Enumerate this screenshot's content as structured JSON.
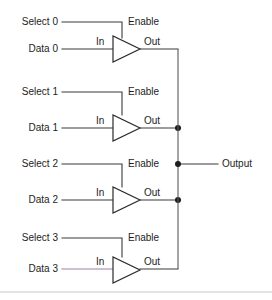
{
  "diagram": {
    "background_color": "#ffffff",
    "wire_color": "#3a3a3a",
    "accent_wire_color": "#9b7fa8",
    "text_color": "#1d1d1d",
    "output_label": "Output",
    "divider_color": "#c9c9c9",
    "stages": [
      {
        "select_label": "Select 0",
        "data_label": "Data 0",
        "enable_label": "Enable",
        "in_label": "In",
        "out_label": "Out",
        "data_wire_color": "#3a3a3a",
        "bus_junction": false
      },
      {
        "select_label": "Select 1",
        "data_label": "Data 1",
        "enable_label": "Enable",
        "in_label": "In",
        "out_label": "Out",
        "data_wire_color": "#3a3a3a",
        "bus_junction": true
      },
      {
        "select_label": "Select 2",
        "data_label": "Data 2",
        "enable_label": "Enable",
        "in_label": "In",
        "out_label": "Out",
        "data_wire_color": "#3a3a3a",
        "bus_junction": true
      },
      {
        "select_label": "Select 3",
        "data_label": "Data 3",
        "enable_label": "Enable",
        "in_label": "In",
        "out_label": "Out",
        "data_wire_color": "#9b7fa8",
        "bus_junction": false
      }
    ]
  }
}
